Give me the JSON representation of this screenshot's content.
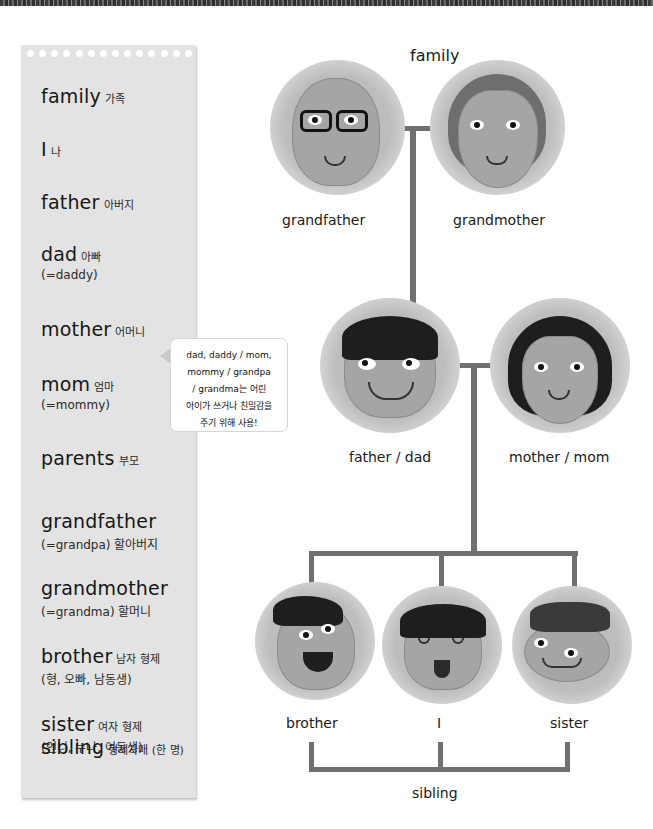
{
  "vocab_panel": {
    "items": [
      {
        "en": "family",
        "ko": "가족",
        "alt": ""
      },
      {
        "en": "I",
        "ko": "나",
        "alt": ""
      },
      {
        "en": "father",
        "ko": "아버지",
        "alt": ""
      },
      {
        "en": "dad",
        "ko": "아빠",
        "alt": "(=daddy)"
      },
      {
        "en": "mother",
        "ko": "어머니",
        "alt": ""
      },
      {
        "en": "mom",
        "ko": "엄마",
        "alt": "(=mommy)"
      },
      {
        "en": "parents",
        "ko": "부모",
        "alt": ""
      },
      {
        "en": "grandfather",
        "ko": "",
        "alt": "(=grandpa) 할아버지"
      },
      {
        "en": "grandmother",
        "ko": "",
        "alt": "(=grandma) 할머니"
      },
      {
        "en": "brother",
        "ko": "남자 형제",
        "alt": "(형, 오빠, 남동생)"
      },
      {
        "en": "sister",
        "ko": "여자 형제",
        "alt": "(언니, 누나, 여동생)"
      },
      {
        "en": "sibling",
        "ko": "형제자매 (한 명)",
        "alt": ""
      }
    ]
  },
  "tooltip": {
    "lines": [
      "dad, daddy / mom,",
      "mommy / grandpa",
      "/ grandma는 어린",
      "아이가 쓰거나 친밀감을",
      "주기 위해 사용!"
    ]
  },
  "tree": {
    "title": "family",
    "labels": {
      "grandfather": "grandfather",
      "grandmother": "grandmother",
      "father": "father / dad",
      "mother": "mother / mom",
      "brother": "brother",
      "me": "I",
      "sister": "sister",
      "sibling": "sibling"
    },
    "line_color": "#707070"
  }
}
